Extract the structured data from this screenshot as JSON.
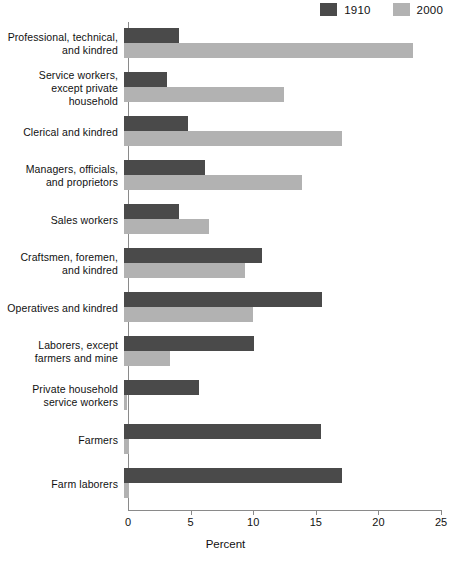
{
  "chart_data": {
    "type": "bar",
    "orientation": "horizontal",
    "title": "",
    "xlabel": "Percent",
    "ylabel": "",
    "xlim": [
      0,
      25
    ],
    "xticks": [
      0,
      5,
      10,
      15,
      20,
      25
    ],
    "grid": false,
    "legend_position": "top-right",
    "categories": [
      "Professional, technical,\nand kindred",
      "Service workers,\nexcept private household",
      "Clerical and kindred",
      "Managers, officials,\nand proprietors",
      "Sales workers",
      "Craftsmen, foremen,\nand kindred",
      "Operatives and kindred",
      "Laborers, except\nfarmers and mine",
      "Private household\nservice workers",
      "Farmers",
      "Farm laborers"
    ],
    "series": [
      {
        "name": "1910",
        "color": "#4a4a4a",
        "values": [
          4.4,
          3.4,
          5.1,
          6.5,
          4.4,
          11.0,
          15.8,
          10.4,
          6.0,
          15.7,
          17.4
        ]
      },
      {
        "name": "2000",
        "color": "#b2b2b2",
        "values": [
          23.1,
          12.8,
          17.4,
          14.2,
          6.8,
          9.7,
          10.3,
          3.7,
          0.2,
          0.4,
          0.4
        ]
      }
    ]
  },
  "legend": {
    "entries": [
      {
        "label": "1910",
        "color": "#4a4a4a"
      },
      {
        "label": "2000",
        "color": "#b2b2b2"
      }
    ]
  },
  "axis": {
    "x_title": "Percent",
    "tick_labels": [
      "0",
      "5",
      "10",
      "15",
      "20",
      "25"
    ]
  }
}
